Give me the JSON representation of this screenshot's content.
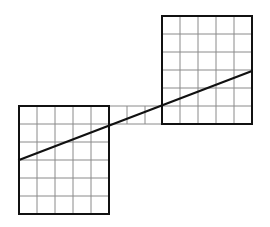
{
  "diagram": {
    "grid_color": "#8a8a8a",
    "border_color": "#111111",
    "line_color": "#111111",
    "cell_size": 18,
    "left_square": {
      "x": 19,
      "y": 106,
      "cols": 5,
      "rows": 6
    },
    "right_square": {
      "x": 162,
      "y": 16,
      "cols": 5,
      "rows": 6
    },
    "connector_strip": {
      "x": 109,
      "y": 106,
      "cols": 3,
      "rows": 1
    },
    "diagonal_line": {
      "x1": 19,
      "y1": 160,
      "x2": 252,
      "y2": 71
    }
  }
}
